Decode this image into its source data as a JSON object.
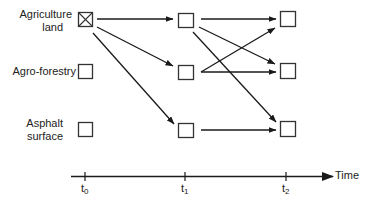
{
  "diagram": {
    "rows": [
      {
        "id": "agriculture",
        "label_line1": "Agriculture",
        "label_line2": "land"
      },
      {
        "id": "agroforestry",
        "label_line1": "Agro-forestry"
      },
      {
        "id": "asphalt",
        "label_line1": "Asphalt",
        "label_line2": "surface"
      }
    ],
    "time_axis": {
      "label": "Time",
      "ticks": [
        {
          "base": "t",
          "sub": "0"
        },
        {
          "base": "t",
          "sub": "1"
        },
        {
          "base": "t",
          "sub": "2"
        }
      ]
    },
    "nodes": [
      {
        "time": "t0",
        "row": "agriculture",
        "marked": true
      },
      {
        "time": "t0",
        "row": "agroforestry",
        "marked": false
      },
      {
        "time": "t0",
        "row": "asphalt",
        "marked": false
      },
      {
        "time": "t1",
        "row": "agriculture"
      },
      {
        "time": "t1",
        "row": "agroforestry"
      },
      {
        "time": "t1",
        "row": "asphalt"
      },
      {
        "time": "t2",
        "row": "agriculture"
      },
      {
        "time": "t2",
        "row": "agroforestry"
      },
      {
        "time": "t2",
        "row": "asphalt"
      }
    ],
    "transitions": [
      {
        "from": "t0.agriculture",
        "to": "t1.agriculture"
      },
      {
        "from": "t0.agriculture",
        "to": "t1.agroforestry"
      },
      {
        "from": "t0.agriculture",
        "to": "t1.asphalt"
      },
      {
        "from": "t1.agriculture",
        "to": "t2.agriculture"
      },
      {
        "from": "t1.agriculture",
        "to": "t2.agroforestry"
      },
      {
        "from": "t1.agriculture",
        "to": "t2.asphalt"
      },
      {
        "from": "t1.agroforestry",
        "to": "t2.agriculture"
      },
      {
        "from": "t1.agroforestry",
        "to": "t2.agroforestry"
      },
      {
        "from": "t1.asphalt",
        "to": "t2.asphalt"
      }
    ]
  }
}
